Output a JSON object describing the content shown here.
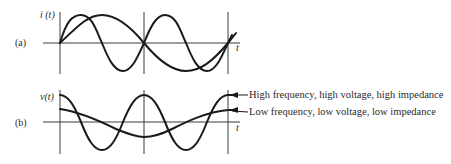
{
  "panel_a": {
    "label": "(a)",
    "y_axis_label": "i (t)",
    "x_axis_label": "t"
  },
  "panel_b": {
    "label": "(b)",
    "y_axis_label": "v(t)",
    "x_axis_label": "t",
    "annotations": [
      {
        "text": "High frequency, high voltage, high impedance",
        "target": "high-frequency-curve"
      },
      {
        "text": "Low frequency, low voltage, low impedance",
        "target": "low-frequency-curve"
      }
    ]
  },
  "colors": {
    "ink": "#1a1a1a",
    "axis": "#3a3a3a",
    "background": "#ffffff"
  }
}
